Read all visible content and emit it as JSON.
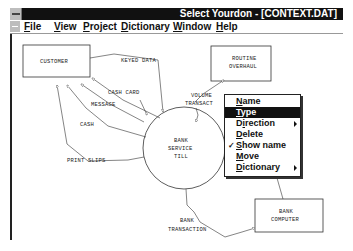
{
  "window": {
    "title": "Select Yourdon - [CONTEXT.DAT]"
  },
  "menubar": {
    "items": [
      {
        "label_u": "F",
        "label_rest": "ile"
      },
      {
        "label_u": "V",
        "label_rest": "iew"
      },
      {
        "label_u": "P",
        "label_rest": "roject"
      },
      {
        "label_u": "D",
        "label_rest": "ictionary"
      },
      {
        "label_u": "W",
        "label_rest": "indow"
      },
      {
        "label_u": "H",
        "label_rest": "elp"
      }
    ]
  },
  "diagram": {
    "externals": [
      {
        "id": "customer",
        "label": "CUSTOMER"
      },
      {
        "id": "routine_overhaul",
        "line1": "ROUTINE",
        "line2": "OVERHAUL"
      },
      {
        "id": "bank_computer",
        "line1": "BANK",
        "line2": "COMPUTER"
      }
    ],
    "process": {
      "line1": "BANK",
      "line2": "SERVICE",
      "line3": "TILL"
    },
    "flows": {
      "keyed_data": "KEYED DATA",
      "cash_card": "CASH CARD",
      "message": "MESSAGE",
      "cash": "CASH",
      "print_slips": "PRINT SLIPS",
      "volume_line1": "VOLUME",
      "volume_line2": "TRANSACT",
      "bank_transaction_line1": "BANK",
      "bank_transaction_line2": "TRANSACTION"
    }
  },
  "context_menu": {
    "items": [
      {
        "u": "N",
        "rest": "ame",
        "selected": false,
        "submenu": false,
        "checked": false
      },
      {
        "u": "T",
        "rest": "ype",
        "selected": true,
        "submenu": false,
        "checked": false
      },
      {
        "pre": "D",
        "u": "i",
        "rest": "rection",
        "selected": false,
        "submenu": true,
        "checked": false
      },
      {
        "u": "D",
        "rest": "elete",
        "selected": false,
        "submenu": false,
        "checked": false
      },
      {
        "u": "S",
        "rest": "how name",
        "selected": false,
        "submenu": false,
        "checked": true
      },
      {
        "u": "M",
        "rest": "ove",
        "selected": false,
        "submenu": false,
        "checked": false
      },
      {
        "u": "D",
        "rest": "ictionary",
        "selected": false,
        "submenu": true,
        "checked": false
      }
    ],
    "check_glyph": "✓"
  }
}
